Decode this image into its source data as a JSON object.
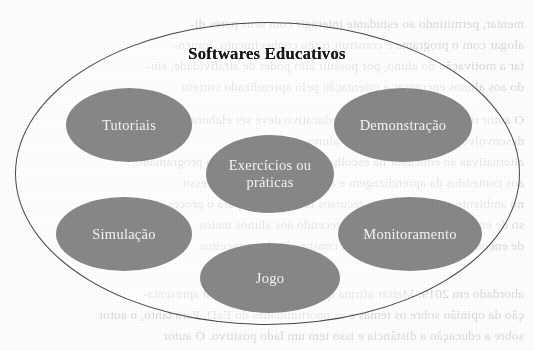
{
  "diagram": {
    "title": "Softwares Educativos",
    "type": "concept-map-ellipse",
    "outer_shape": "ellipse",
    "colors": {
      "page_background": "#fdfdfc",
      "node_fill": "#878787",
      "node_label": "#f4f4f2",
      "outline": "#4a4845",
      "title_text": "#1b1a18",
      "bleed_text": "#2a2724"
    },
    "nodes": [
      {
        "id": "tutoriais",
        "label": "Tutoriais"
      },
      {
        "id": "demonstracao",
        "label": "Demonstração"
      },
      {
        "id": "exercicios",
        "label": "Exercícios ou\npráticas"
      },
      {
        "id": "simulacao",
        "label": "Simulação"
      },
      {
        "id": "monitoramento",
        "label": "Monitoramento"
      },
      {
        "id": "jogo",
        "label": "Jogo"
      }
    ]
  },
  "background_bleedthrough": {
    "description": "faint mirrored show-through text from the reverse side of the scanned page",
    "lines": [
      "mentar, permitindo ao estudante interagir com seus pares di-",
      "alogar com o programa e construir o seu conhecimento, fomen-",
      "tar a motivação do aluno, por possuir alto poder de atratividade, sin-",
      "do aos alunos encontrar a orientação pelo aprendizado correto",
      "O autor ressalta que um software educativo deve ser elaborado",
      "desenvolvendo as habilidades do aluno. Apresenta",
      "alternativas ao educador na escolha do material de ensino programado,",
      "aos conteúdos da aprendizagem e a avaliação do seu processo",
      "no ambiente escolar, com os recursos tecnológicos para o proces-",
      "so de ensino e aprendizagem, oferecendo aos alunos meios",
      "de encontrar respostas e chegar a construção dos conceitos",
      "abordado em 2019. Mattar afirma que esse, em conjunto à apresenta-",
      "ção da opinião sobre os temas e as oportunidades do EaD. Para tanto, o autor",
      "sobre a educação a distância e isso tem um lado positivo. O autor"
    ]
  }
}
